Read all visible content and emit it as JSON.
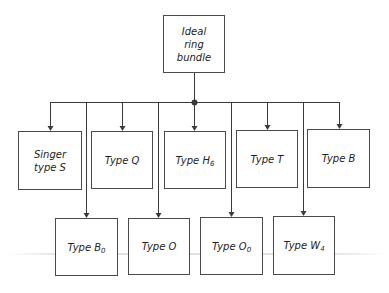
{
  "diagram": {
    "root": {
      "id": "root",
      "label": "Ideal\nring\nbundle",
      "x": 163,
      "y": 15,
      "w": 62,
      "h": 58
    },
    "junction": {
      "x": 194,
      "y": 102
    },
    "bus": {
      "y": 102,
      "x1": 50,
      "x2": 339
    },
    "children_row1": [
      {
        "id": "singer",
        "label": "Singer\ntype S",
        "sub": "",
        "x": 18,
        "y": 131,
        "w": 64,
        "h": 59,
        "drop_x": 50
      },
      {
        "id": "q",
        "label": "Type Q",
        "sub": "",
        "x": 91,
        "y": 131,
        "w": 62,
        "h": 58,
        "drop_x": 122
      },
      {
        "id": "h6",
        "label": "Type H",
        "sub": "6",
        "x": 164,
        "y": 131,
        "w": 62,
        "h": 58,
        "drop_x": 194
      },
      {
        "id": "t",
        "label": "Type T",
        "sub": "",
        "x": 236,
        "y": 130,
        "w": 62,
        "h": 58,
        "drop_x": 267
      },
      {
        "id": "b",
        "label": "Type B",
        "sub": "",
        "x": 307,
        "y": 129,
        "w": 63,
        "h": 59,
        "drop_x": 339
      }
    ],
    "children_row2": [
      {
        "id": "b0",
        "label": "Type B",
        "sub": "0",
        "x": 55,
        "y": 218,
        "w": 63,
        "h": 58,
        "drop_x": 86
      },
      {
        "id": "o",
        "label": "Type O",
        "sub": "",
        "x": 128,
        "y": 218,
        "w": 62,
        "h": 57,
        "drop_x": 158
      },
      {
        "id": "o0",
        "label": "Type O",
        "sub": "0",
        "x": 200,
        "y": 217,
        "w": 63,
        "h": 58,
        "drop_x": 231
      },
      {
        "id": "w4",
        "label": "Type W",
        "sub": "4",
        "x": 273,
        "y": 216,
        "w": 62,
        "h": 59,
        "drop_x": 303
      }
    ],
    "colors": {
      "line": "#3a3a3a",
      "border": "#4a4a4a",
      "text": "#222222"
    }
  }
}
